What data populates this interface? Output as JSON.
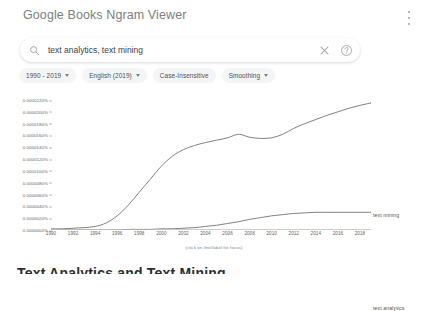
{
  "header": {
    "app_title": "Google Books Ngram Viewer",
    "overflow_menu_icon": "more-vert-icon"
  },
  "search": {
    "icon": "search-icon",
    "value": "text analytics, text mining",
    "placeholder": "Search Google Books Ngram Viewer",
    "clear_icon": "close-icon",
    "help_icon": "help-circle-icon"
  },
  "filters": {
    "chips": [
      {
        "label": "1990 - 2019",
        "has_caret": true
      },
      {
        "label": "English (2019)",
        "has_caret": true
      },
      {
        "label": "Case-Insensitive",
        "has_caret": false
      },
      {
        "label": "Smoothing",
        "has_caret": true
      }
    ]
  },
  "chart_hint": "(click on line/label for focus)",
  "bottom_cut_heading": "Text Analytics and Text Mining",
  "chart_data": {
    "type": "line",
    "title": "",
    "xlabel": "",
    "ylabel": "",
    "xlim": [
      1990,
      2019
    ],
    "ylim": [
      0.0,
      2.2e-06
    ],
    "grid": false,
    "legend_position": "right-inline",
    "x_ticks": [
      1990,
      1992,
      1994,
      1996,
      1998,
      2000,
      2002,
      2004,
      2006,
      2008,
      2010,
      2012,
      2014,
      2016,
      2018
    ],
    "y_ticks": [
      "0.0000000%",
      "0.0000020%",
      "0.0000040%",
      "0.0000060%",
      "0.0000080%",
      "0.0000100%",
      "0.0000120%",
      "0.0000140%",
      "0.0000160%",
      "0.0000180%",
      "0.0000200%",
      "0.0000220%"
    ],
    "y_tick_values": [
      0.0,
      2e-07,
      4e-07,
      6e-07,
      8e-07,
      1e-06,
      1.2e-06,
      1.4e-06,
      1.6e-06,
      1.8e-06,
      2e-06,
      2.2e-06
    ],
    "x": [
      1990,
      1991,
      1992,
      1993,
      1994,
      1995,
      1996,
      1997,
      1998,
      1999,
      2000,
      2001,
      2002,
      2003,
      2004,
      2005,
      2006,
      2007,
      2008,
      2009,
      2010,
      2011,
      2012,
      2013,
      2014,
      2015,
      2016,
      2017,
      2018,
      2019
    ],
    "series": [
      {
        "name": "text mining",
        "color": "#707478",
        "values": [
          2e-08,
          2e-08,
          3e-08,
          4e-08,
          6e-08,
          1.2e-07,
          2.4e-07,
          4.2e-07,
          6.4e-07,
          8.6e-07,
          1.08e-06,
          1.25e-06,
          1.36e-06,
          1.43e-06,
          1.48e-06,
          1.52e-06,
          1.56e-06,
          1.62e-06,
          1.57e-06,
          1.55e-06,
          1.56e-06,
          1.62e-06,
          1.72e-06,
          1.8e-06,
          1.87e-06,
          1.94e-06,
          2e-06,
          2.06e-06,
          2.11e-06,
          2.15e-06
        ]
      },
      {
        "name": "text analytics",
        "color": "#707478",
        "values": [
          0.0,
          0.0,
          0.0,
          0.0,
          0.0,
          0.0,
          0.0,
          1e-08,
          1e-08,
          1e-08,
          2e-08,
          2e-08,
          3e-08,
          4e-08,
          6e-08,
          8e-08,
          1.1e-07,
          1.4e-07,
          1.8e-07,
          2.1e-07,
          2.4e-07,
          2.6e-07,
          2.8e-07,
          2.9e-07,
          3e-07,
          3e-07,
          3e-07,
          3e-07,
          3e-07,
          3e-07
        ]
      }
    ]
  }
}
